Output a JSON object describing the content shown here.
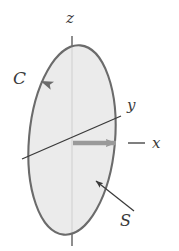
{
  "figure": {
    "background_color": "#ffffff",
    "colors": {
      "surface_fill": "#e8e8e8",
      "curve_stroke": "#6b6b6b",
      "axis_stroke": "#3a3a3a",
      "x_axis_arrow": "#9a9a9a",
      "label_color": "#3a3a3a",
      "pointer_stroke": "#3a3a3a"
    },
    "labels": {
      "z_axis": "z",
      "y_axis": "y",
      "x_axis": "x",
      "curve": "C",
      "surface": "S"
    },
    "geometry": {
      "ellipse_center_x": 72,
      "ellipse_center_y": 140,
      "ellipse_radius_x": 43,
      "ellipse_radius_y": 95,
      "ellipse_rotation_deg": 5,
      "origin_x": 72,
      "origin_y": 143,
      "z_axis_top_y": 36,
      "z_axis_bottom_y": 246,
      "y_axis_start": [
        22,
        158
      ],
      "y_axis_end": [
        120,
        116
      ],
      "x_axis_arrow_tip": [
        124,
        143
      ],
      "x_axis_tail_end": [
        144,
        143
      ],
      "curve_arrow_at": [
        40,
        80
      ],
      "surface_pointer_from": [
        133,
        210
      ],
      "surface_pointer_to": [
        94,
        180
      ]
    }
  }
}
